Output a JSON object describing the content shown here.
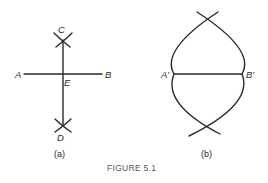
{
  "figure": {
    "caption": "FIGURE 5.1",
    "panel_a": {
      "sublabel": "(a)",
      "points": {
        "A": "A",
        "B": "B",
        "C": "C",
        "D": "D",
        "E": "E"
      }
    },
    "panel_b": {
      "sublabel": "(b)",
      "points": {
        "A_prime": "A'",
        "B_prime": "B'"
      }
    },
    "stroke_color": "#2a2a2a"
  }
}
